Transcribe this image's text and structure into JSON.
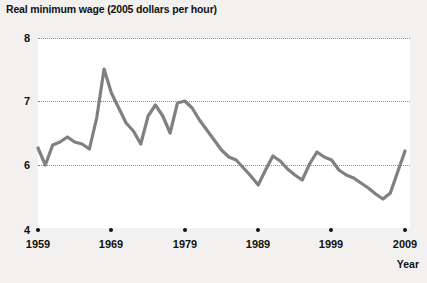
{
  "chart_data": {
    "type": "line",
    "title": "Real minimum wage (2005 dollars per hour)",
    "xlabel": "Year",
    "ylabel": "",
    "grid": true,
    "legend": false,
    "line_color": "#808080",
    "background": "#ffffff",
    "page_background": "#f2f1ef",
    "xlim": [
      1959,
      2009
    ],
    "ylim": [
      4,
      8
    ],
    "y_axis_broken": true,
    "yticks": [
      8,
      7,
      6,
      4
    ],
    "ytick_labels": [
      "8",
      "7",
      "6",
      "4"
    ],
    "gridline_values": [
      8,
      7,
      6
    ],
    "xticks": [
      1959,
      1969,
      1979,
      1989,
      1999,
      2009
    ],
    "xtick_labels": [
      "1959",
      "1969",
      "1979",
      "1989",
      "1999",
      "2009"
    ],
    "x": [
      1959,
      1960,
      1961,
      1962,
      1963,
      1964,
      1965,
      1966,
      1967,
      1968,
      1969,
      1970,
      1971,
      1972,
      1973,
      1974,
      1975,
      1976,
      1977,
      1978,
      1979,
      1980,
      1981,
      1982,
      1983,
      1984,
      1985,
      1986,
      1987,
      1988,
      1989,
      1990,
      1991,
      1992,
      1993,
      1994,
      1995,
      1996,
      1997,
      1998,
      1999,
      2000,
      2001,
      2002,
      2003,
      2004,
      2005,
      2006,
      2007,
      2008,
      2009
    ],
    "values": [
      6.28,
      6.02,
      6.55,
      6.52,
      6.6,
      6.52,
      6.42,
      6.25,
      6.93,
      7.5,
      7.12,
      6.75,
      6.45,
      6.25,
      5.9,
      6.55,
      6.85,
      6.6,
      6.2,
      6.7,
      6.95,
      6.85,
      6.62,
      6.25,
      6.05,
      5.8,
      5.62,
      5.5,
      5.3,
      5.08,
      4.85,
      5.2,
      5.6,
      5.45,
      5.28,
      5.15,
      5.0,
      5.35,
      5.75,
      5.65,
      5.55,
      5.35,
      5.2,
      5.12,
      5.0,
      4.88,
      4.72,
      4.57,
      4.72,
      5.25,
      5.85
    ],
    "line_plot_y": [
      148,
      165,
      145,
      142,
      137,
      142,
      144,
      149,
      118,
      69,
      93,
      108,
      123,
      131,
      144,
      116,
      105,
      116,
      133,
      103,
      101,
      108,
      120,
      130,
      140,
      150,
      157,
      160,
      168,
      176,
      185,
      170,
      156,
      161,
      169,
      175,
      180,
      164,
      152,
      157,
      160,
      170,
      175,
      178,
      183,
      188,
      194,
      199,
      193,
      172,
      151
    ]
  }
}
